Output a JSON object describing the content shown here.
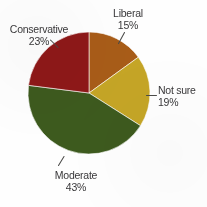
{
  "chart_data": {
    "type": "pie",
    "title": "",
    "subtitle": "",
    "xlabel": "",
    "ylabel": "",
    "legend_position": "none",
    "grid": false,
    "start_angle_deg": 0,
    "direction": "clockwise",
    "categories": [
      "Liberal",
      "Not sure",
      "Moderate",
      "Conservative"
    ],
    "values": [
      15,
      19,
      43,
      23
    ],
    "value_unit": "%",
    "colors": [
      "#a85c18",
      "#c5a526",
      "#3d5a1e",
      "#8e1818"
    ],
    "slices": [
      {
        "label": "Liberal",
        "value": 15,
        "value_text": "15%",
        "color": "#a85c18",
        "start_deg": 0,
        "end_deg": 54
      },
      {
        "label": "Not sure",
        "value": 19,
        "value_text": "19%",
        "color": "#c5a526",
        "start_deg": 54,
        "end_deg": 122.4
      },
      {
        "label": "Moderate",
        "value": 43,
        "value_text": "43%",
        "color": "#3d5a1e",
        "start_deg": 122.4,
        "end_deg": 277.2
      },
      {
        "label": "Conservative",
        "value": 23,
        "value_text": "23%",
        "color": "#8e1818",
        "start_deg": 277.2,
        "end_deg": 360
      }
    ]
  },
  "labels": {
    "liberal": {
      "name": "Liberal",
      "pct": "15%"
    },
    "notsure": {
      "name": "Not sure",
      "pct": "19%"
    },
    "moderate": {
      "name": "Moderate",
      "pct": "43%"
    },
    "conservative": {
      "name": "Conservative",
      "pct": "23%"
    }
  },
  "canvas": {
    "background": "#fefefe",
    "center_x": 89,
    "center_y": 93,
    "radius": 61
  }
}
